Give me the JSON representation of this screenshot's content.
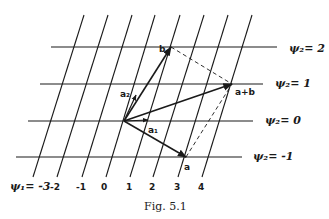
{
  "figure": {
    "caption": "Fig. 5.1",
    "colors": {
      "ink": "#1a1a1a",
      "background": "#ffffff"
    },
    "psi1_axis": {
      "prefix": "ψ",
      "subscript": "1",
      "label_first": "ψ₁= -3",
      "ticks": [
        "-3",
        "-2",
        "-1",
        "0",
        "1",
        "2",
        "3",
        "4"
      ]
    },
    "psi2_lines": [
      {
        "label": "ψ₂= 2",
        "value": "2"
      },
      {
        "label": "ψ₂= 1",
        "value": "1"
      },
      {
        "label": "ψ₂= 0",
        "value": "0"
      },
      {
        "label": "ψ₂= -1",
        "value": "-1"
      }
    ],
    "vectors": {
      "a": "a",
      "b": "b",
      "a_plus_b": "a+b",
      "a1": "a₁",
      "a2": "a₂"
    }
  }
}
